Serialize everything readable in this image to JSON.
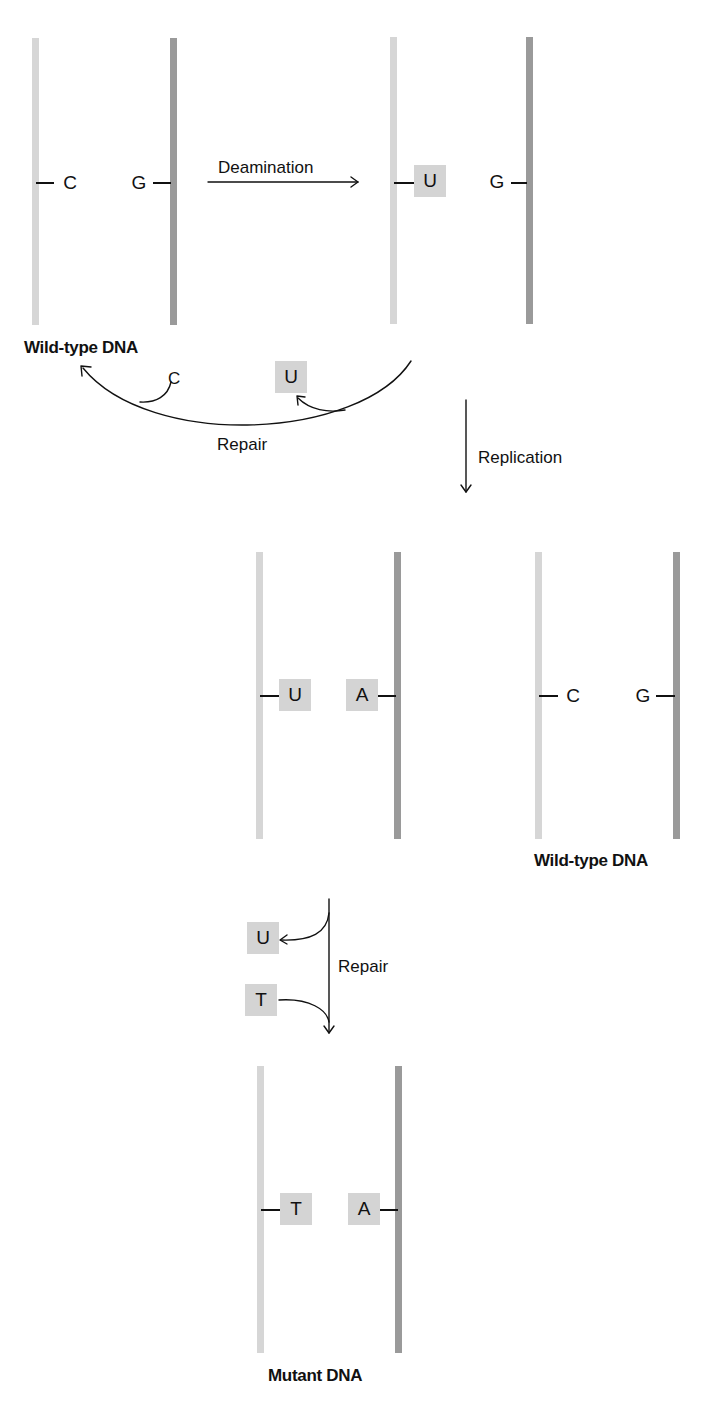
{
  "diagram": {
    "type": "deamination-repair-mutation-flow",
    "panels": [
      {
        "id": "wild-type-1",
        "label": "Wild-type DNA",
        "left_base": "C",
        "left_boxed": false,
        "right_base": "G",
        "right_boxed": false
      },
      {
        "id": "deaminated",
        "label": "",
        "left_base": "U",
        "left_boxed": true,
        "right_base": "G",
        "right_boxed": false
      },
      {
        "id": "replicated-mismatch",
        "label": "",
        "left_base": "U",
        "left_boxed": true,
        "right_base": "A",
        "right_boxed": true
      },
      {
        "id": "wild-type-2",
        "label": "Wild-type DNA",
        "left_base": "C",
        "left_boxed": false,
        "right_base": "G",
        "right_boxed": false
      },
      {
        "id": "mutant",
        "label": "Mutant DNA",
        "left_base": "T",
        "left_boxed": true,
        "right_base": "A",
        "right_boxed": true
      }
    ],
    "arrows": {
      "deamination": {
        "label": "Deamination"
      },
      "repair_1": {
        "label": "Repair",
        "removed": "U",
        "inserted": "C"
      },
      "replication": {
        "label": "Replication"
      },
      "repair_2": {
        "label": "Repair",
        "removed": "U",
        "inserted": "T"
      }
    },
    "colors": {
      "light_strand": "#d6d6d6",
      "dark_strand": "#9a9a9a",
      "base_box": "#d4d4d4",
      "line": "#111111"
    }
  }
}
